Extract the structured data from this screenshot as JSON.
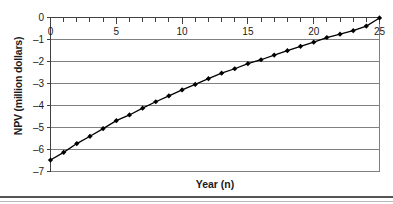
{
  "chart_data": {
    "type": "line",
    "title": "",
    "xlabel": "Year (n)",
    "ylabel": "NPV (million dollars)",
    "xlim": [
      0,
      25
    ],
    "ylim": [
      -7,
      0
    ],
    "x_axis_position": "top",
    "grid": "horizontal",
    "legend": "none",
    "xticks": [
      0,
      5,
      10,
      15,
      20,
      25
    ],
    "xtick_labels": [
      "0",
      "5",
      "10",
      "15",
      "20",
      "25"
    ],
    "x_minor_tick_interval": 1,
    "yticks": [
      0,
      -1,
      -2,
      -3,
      -4,
      -5,
      -6,
      -7
    ],
    "ytick_labels": [
      "0",
      "–1",
      "–2",
      "–3",
      "–4",
      "–5",
      "–6",
      "–7"
    ],
    "marker": "diamond",
    "line_color": "#000000",
    "marker_color": "#000000",
    "grid_color": "#808080",
    "x": [
      0,
      1,
      2,
      3,
      4,
      5,
      6,
      7,
      8,
      9,
      10,
      11,
      12,
      13,
      14,
      15,
      16,
      17,
      18,
      19,
      20,
      21,
      22,
      23,
      24,
      25
    ],
    "values": [
      -6.48,
      -6.13,
      -5.73,
      -5.4,
      -5.05,
      -4.69,
      -4.43,
      -4.12,
      -3.83,
      -3.56,
      -3.29,
      -3.04,
      -2.78,
      -2.53,
      -2.33,
      -2.1,
      -1.92,
      -1.71,
      -1.51,
      -1.31,
      -1.12,
      -0.91,
      -0.76,
      -0.6,
      -0.39,
      -0.02
    ],
    "series": [
      {
        "name": "NPV",
        "values": [
          -6.48,
          -6.13,
          -5.73,
          -5.4,
          -5.05,
          -4.69,
          -4.43,
          -4.12,
          -3.83,
          -3.56,
          -3.29,
          -3.04,
          -2.78,
          -2.53,
          -2.33,
          -2.1,
          -1.92,
          -1.71,
          -1.51,
          -1.31,
          -1.12,
          -0.91,
          -0.76,
          -0.6,
          -0.39,
          -0.02
        ]
      }
    ]
  },
  "axes": {
    "x_title": "Year (n)",
    "y_title": "NPV (million dollars)"
  }
}
